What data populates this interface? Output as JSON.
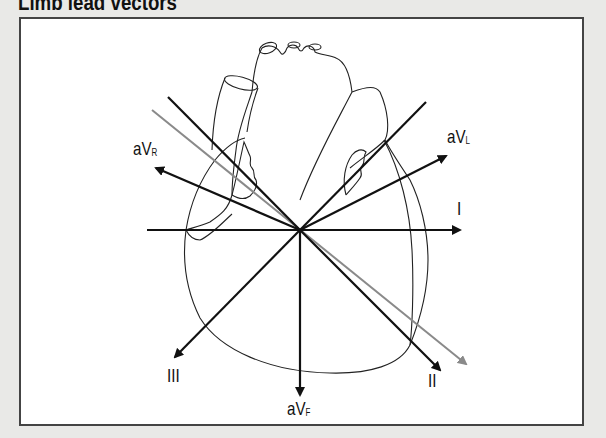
{
  "title": "Limb lead vectors",
  "colors": {
    "background": "#e9e9e7",
    "panel": "#ffffff",
    "border": "#444444",
    "vector": "#111111",
    "mean_axis": "#8a8a8a",
    "heart_outline": "#222222"
  },
  "leads": {
    "aVR": {
      "main": "aV",
      "sub": "R"
    },
    "aVL": {
      "main": "aV",
      "sub": "L"
    },
    "I": {
      "label": "I"
    },
    "II": {
      "label": "II"
    },
    "III": {
      "label": "III"
    },
    "aVF": {
      "main": "aV",
      "sub": "F"
    }
  },
  "vectors": [
    {
      "name": "I",
      "angle_deg": 0
    },
    {
      "name": "II",
      "angle_deg": 60
    },
    {
      "name": "III",
      "angle_deg": 120
    },
    {
      "name": "aVR",
      "angle_deg": -150
    },
    {
      "name": "aVL",
      "angle_deg": -30
    },
    {
      "name": "aVF",
      "angle_deg": 90
    },
    {
      "name": "mean-electrical-axis",
      "angle_deg": 39,
      "color": "gray"
    }
  ]
}
